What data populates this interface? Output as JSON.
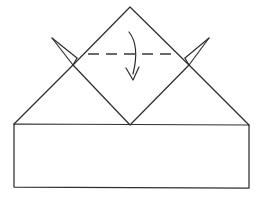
{
  "figure": {
    "background_color": "#ffffff",
    "line_color": "#2f2f2f",
    "crease_color": "#3a3a3a",
    "arrow_color": "#2b2b2b",
    "canvas": {
      "width": 266,
      "height": 197
    }
  },
  "shapes": {
    "base_rectangle": {
      "name": "base-rectangle",
      "label": "Rectangular paper base",
      "points": "14,124 249,125 249,188 14,187"
    },
    "diamond": {
      "name": "rotated-square",
      "label": "Square rotated 45 degrees",
      "points": "130,7 189,65 130,125 73,65",
      "apex_top": "130,7",
      "vertex_right": "189,65",
      "apex_bottom": "130,125",
      "vertex_left": "73,65"
    },
    "left_slope": {
      "name": "left-outer-slope",
      "label": "Left outer fold edge",
      "path": "M 73,65 L 14,124"
    },
    "right_slope": {
      "name": "right-outer-slope",
      "label": "Right outer fold edge",
      "path": "M 189,65 L 249,125"
    }
  },
  "annotations": {
    "dashed_crease": {
      "name": "horizontal-fold-crease",
      "label": "Horizontal valley fold line",
      "path": "M 88,54 L 176,54",
      "style": "dashed"
    },
    "curved_down_arrow": {
      "name": "fold-down-arrow",
      "label": "Fold the top point downward",
      "shaft": "M 129,32 C 137,42 137,58 133,74",
      "head": "M 126,68 L 133,80 L 139,67"
    },
    "left_spread_arrow": {
      "name": "left-spread-arrow",
      "label": "Spread the left corner outward",
      "tip": "52,38",
      "barb_upper": "M 52,38 L 73,65",
      "barb_lower": "M 52,38 L 77,58",
      "barb_close": "M 77,58 L 73,65"
    },
    "right_spread_arrow": {
      "name": "right-spread-arrow",
      "label": "Spread the right corner outward",
      "tip": "209,38",
      "barb_upper": "M 209,38 L 189,65",
      "barb_lower": "M 209,38 L 185,58",
      "barb_close": "M 185,58 L 189,65"
    }
  }
}
